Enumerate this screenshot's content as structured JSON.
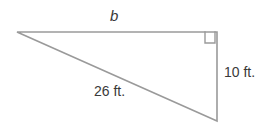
{
  "figure": {
    "type": "right-triangle-diagram",
    "background_color": "#ffffff",
    "stroke_color": "#9a9a9a",
    "text_color": "#3a3a3a",
    "stroke_width": 1.6,
    "vertices": {
      "left": {
        "x": 17,
        "y": 32
      },
      "top_right": {
        "x": 217,
        "y": 32
      },
      "bottom_right": {
        "x": 217,
        "y": 121
      }
    },
    "right_angle_marker": {
      "name": "right-angle-square",
      "x": 205,
      "y": 32,
      "size": 11
    },
    "labels": {
      "top_side": "b",
      "vertical_side": "10 ft.",
      "hypotenuse": "26 ft."
    }
  },
  "chart_data": {
    "type": "diagram",
    "title": "",
    "shape": "right triangle",
    "sides": [
      {
        "name": "top side (adjacent)",
        "label": "b",
        "known": false,
        "units": "ft."
      },
      {
        "name": "vertical side (opposite)",
        "label": "10 ft.",
        "value": 10,
        "units": "ft.",
        "known": true
      },
      {
        "name": "hypotenuse",
        "label": "26 ft.",
        "value": 26,
        "units": "ft.",
        "known": true
      }
    ],
    "right_angle_at": "top-right vertex"
  }
}
